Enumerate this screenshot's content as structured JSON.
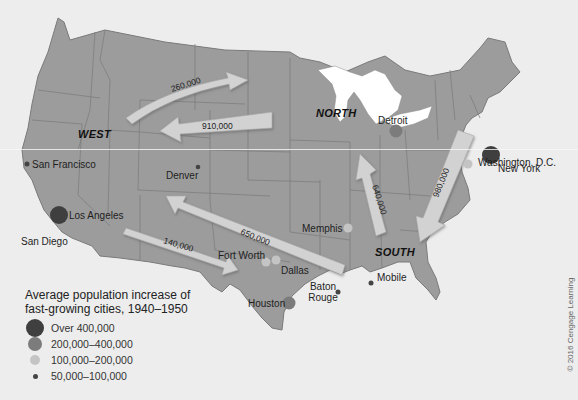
{
  "map": {
    "title": "Population migration in the United States, 1940–1950",
    "colors": {
      "land": "#9c9c9c",
      "water": "#ededed",
      "lakes": "#ffffff",
      "border": "#7a7a7a",
      "arrow_fill": "#d2d2d2",
      "arrow_edge": "#a8a8a8",
      "over_400k": "#3f3f3f",
      "200k_400k": "#7c7c7c",
      "100k_200k": "#c4c4c4",
      "50k_100k": "#444444"
    },
    "regions": [
      {
        "name": "WEST"
      },
      {
        "name": "NORTH"
      },
      {
        "name": "SOUTH"
      }
    ],
    "migration_arrows": [
      {
        "label": "260,000",
        "from": "West",
        "to": "North"
      },
      {
        "label": "910,000",
        "from": "North",
        "to": "West"
      },
      {
        "label": "650,000",
        "from": "South",
        "to": "West"
      },
      {
        "label": "140,000",
        "from": "West",
        "to": "South"
      },
      {
        "label": "640,000",
        "from": "South",
        "to": "North"
      },
      {
        "label": "980,000",
        "from": "North",
        "to": "South"
      }
    ],
    "cities": [
      {
        "name": "San Francisco",
        "category": "50,000–100,000"
      },
      {
        "name": "Los Angeles",
        "category": "Over 400,000"
      },
      {
        "name": "San Diego",
        "category": "100,000–200,000"
      },
      {
        "name": "Denver",
        "category": "50,000–100,000"
      },
      {
        "name": "Detroit",
        "category": "200,000–400,000"
      },
      {
        "name": "New York",
        "category": "Over 400,000"
      },
      {
        "name": "Washington, D.C.",
        "category": "100,000–200,000"
      },
      {
        "name": "Memphis",
        "category": "100,000–200,000"
      },
      {
        "name": "Fort Worth",
        "category": "100,000–200,000"
      },
      {
        "name": "Dallas",
        "category": "100,000–200,000"
      },
      {
        "name": "Houston",
        "category": "200,000–400,000"
      },
      {
        "name": "Baton Rouge",
        "category": "50,000–100,000"
      },
      {
        "name": "Mobile",
        "category": "50,000–100,000"
      }
    ]
  },
  "legend": {
    "title_line1": "Average population increase of",
    "title_line2": "fast-growing cities, 1940–1950",
    "items": [
      {
        "label": "Over 400,000",
        "color": "#3f3f3f",
        "size": 20
      },
      {
        "label": "200,000–400,000",
        "color": "#7c7c7c",
        "size": 15
      },
      {
        "label": "100,000–200,000",
        "color": "#c4c4c4",
        "size": 11
      },
      {
        "label": "50,000–100,000",
        "color": "#444444",
        "size": 5
      }
    ]
  },
  "copyright": "© 2016 Cengage Learning"
}
